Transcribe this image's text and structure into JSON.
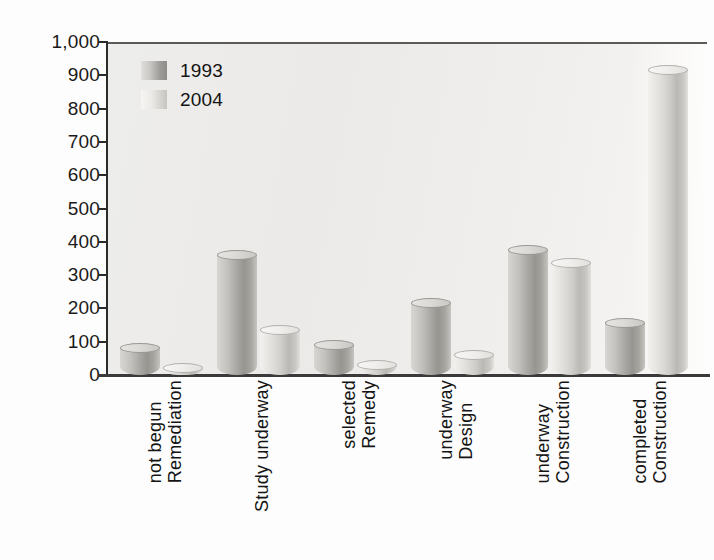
{
  "chart_data": {
    "type": "bar",
    "title": "",
    "subtitle": "",
    "xlabel": "",
    "ylabel": "Number of sites",
    "ylim": [
      0,
      1000
    ],
    "ytick_values": [
      0,
      100,
      200,
      300,
      400,
      500,
      600,
      700,
      800,
      900,
      1000
    ],
    "ytick_labels": [
      "0",
      "100",
      "200",
      "300",
      "400",
      "500",
      "600",
      "700",
      "800",
      "900",
      "1,000"
    ],
    "grid": false,
    "legend_position": "top-left",
    "categories": [
      "Remediation not begun",
      "Study underway",
      "Remedy selected",
      "Design underway",
      "Construction underway",
      "Construction completed"
    ],
    "category_lines": [
      [
        "Remediation",
        "not begun"
      ],
      [
        "Study underway"
      ],
      [
        "Remedy",
        "selected"
      ],
      [
        "Design",
        "underway"
      ],
      [
        "Construction",
        "underway"
      ],
      [
        "Construction",
        "completed"
      ]
    ],
    "series": [
      {
        "name": "1993",
        "color": "#a9a7a4",
        "values": [
          80,
          360,
          90,
          215,
          375,
          155
        ]
      },
      {
        "name": "2004",
        "color": "#d8d6d3",
        "values": [
          20,
          135,
          30,
          60,
          335,
          915
        ]
      }
    ]
  },
  "legend": {
    "items": [
      {
        "label": "1993"
      },
      {
        "label": "2004"
      }
    ]
  }
}
